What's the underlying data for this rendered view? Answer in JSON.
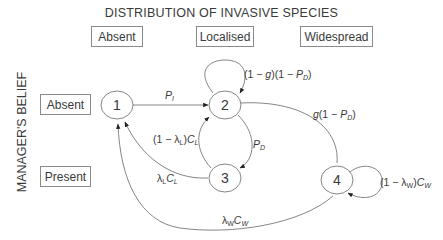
{
  "title": "DISTRIBUTION OF INVASIVE SPECIES",
  "columns": [
    "Absent",
    "Localised",
    "Widespread"
  ],
  "y_axis_label": "MANAGER'S BELIEF",
  "rows": [
    "Absent",
    "Present"
  ],
  "nodes": [
    {
      "id": "1",
      "label": "1"
    },
    {
      "id": "2",
      "label": "2"
    },
    {
      "id": "3",
      "label": "3"
    },
    {
      "id": "4",
      "label": "4"
    }
  ],
  "edges": [
    {
      "from": "1",
      "to": "2",
      "label": "P_I"
    },
    {
      "from": "2",
      "to": "2",
      "label": "(1 − g)(1 − P_D)"
    },
    {
      "from": "2",
      "to": "3",
      "label": "P_D"
    },
    {
      "from": "3",
      "to": "2",
      "label": "(1 − λ_L)C_L"
    },
    {
      "from": "3",
      "to": "1",
      "label": "λ_L C_L"
    },
    {
      "from": "2",
      "to": "4",
      "label": "g(1 − P_D)"
    },
    {
      "from": "4",
      "to": "4",
      "label": "(1 − λ_W)C_W"
    },
    {
      "from": "4",
      "to": "1",
      "label": "λ_W C_W"
    }
  ],
  "edge_text": {
    "pi_main": "P",
    "pi_sub": "I",
    "self2_a": "(1 − ",
    "self2_g": "g",
    "self2_b": ")(1 − ",
    "self2_p": "P",
    "self2_sub": "D",
    "self2_c": ")",
    "pd_main": "P",
    "pd_sub": "D",
    "l32_a": "(1 − λ",
    "l32_sub1": "L",
    "l32_b": ")",
    "l32_c": "C",
    "l32_sub2": "L",
    "l31_a": "λ",
    "l31_sub1": "L",
    "l31_c": "C",
    "l31_sub2": "L",
    "g24_g": "g",
    "g24_a": "(1 − ",
    "g24_p": "P",
    "g24_sub": "D",
    "g24_b": ")",
    "self4_a": "(1 − λ",
    "self4_sub1": "W",
    "self4_b": ")",
    "self4_c": "C",
    "self4_sub2": "W",
    "l41_a": "λ",
    "l41_sub1": "W",
    "l41_c": "C",
    "l41_sub2": "W"
  }
}
